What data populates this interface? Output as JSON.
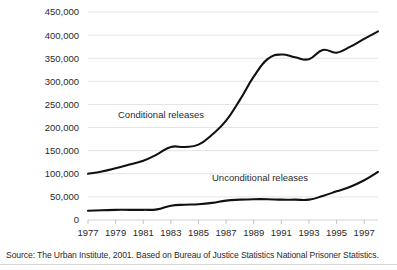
{
  "source_note": "Source:  The Urban Institute, 2001. Based on Bureau of Justice Statistics National Prisoner Statistics.",
  "labels": {
    "conditional": "Conditional releases",
    "unconditional": "Unconditional releases"
  },
  "chart_data": {
    "type": "line",
    "title": "",
    "xlabel": "",
    "ylabel": "",
    "grid": true,
    "legend": "inline-annotations",
    "xlim": [
      1977,
      1998
    ],
    "ylim": [
      0,
      450000
    ],
    "yticks": [
      0,
      50000,
      100000,
      150000,
      200000,
      250000,
      300000,
      350000,
      400000,
      450000
    ],
    "ytick_labels": [
      "0",
      "50,000",
      "100,000",
      "150,000",
      "200,000",
      "250,000",
      "300,000",
      "350,000",
      "400,000",
      "450,000"
    ],
    "xticks": [
      1977,
      1979,
      1981,
      1983,
      1985,
      1987,
      1989,
      1991,
      1993,
      1995,
      1997
    ],
    "xtick_labels": [
      "1977",
      "1979",
      "1981",
      "1983",
      "1985",
      "1987",
      "1989",
      "1991",
      "1993",
      "1995",
      "1997"
    ],
    "x": [
      1977,
      1978,
      1979,
      1980,
      1981,
      1982,
      1983,
      1984,
      1985,
      1986,
      1987,
      1988,
      1989,
      1990,
      1991,
      1992,
      1993,
      1994,
      1995,
      1996,
      1997,
      1998
    ],
    "series": [
      {
        "name": "Conditional releases",
        "values": [
          100000,
          105000,
          112000,
          120000,
          128000,
          142000,
          158000,
          158000,
          163000,
          185000,
          215000,
          260000,
          310000,
          348000,
          358000,
          352000,
          348000,
          368000,
          362000,
          375000,
          392000,
          408000
        ]
      },
      {
        "name": "Unconditional releases",
        "values": [
          20000,
          21000,
          22000,
          22000,
          22000,
          23000,
          31000,
          33000,
          34000,
          37000,
          42000,
          44000,
          45000,
          45000,
          44000,
          44000,
          44000,
          52000,
          62000,
          72000,
          86000,
          104000
        ]
      }
    ]
  }
}
